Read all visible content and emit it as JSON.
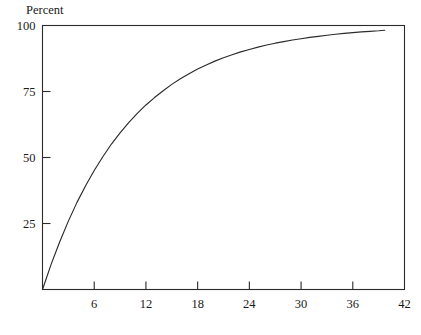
{
  "chart_data": {
    "type": "line",
    "title": "",
    "subtitle": "",
    "ylabel": "Percent",
    "xlabel": "",
    "xlim": [
      0,
      42
    ],
    "ylim": [
      0,
      100
    ],
    "grid": false,
    "legend": null,
    "x_ticks": [
      6,
      12,
      18,
      24,
      30,
      36,
      42
    ],
    "x_tick_labels": [
      "6",
      "12",
      "18",
      "24",
      "30",
      "36",
      "42"
    ],
    "y_ticks": [
      25,
      50,
      75,
      100
    ],
    "y_tick_labels": [
      "25",
      "50",
      "75",
      "100"
    ],
    "series": [
      {
        "name": "cumulative percent",
        "x": [
          0,
          1,
          2,
          3,
          4,
          5,
          6,
          7,
          8,
          9,
          10,
          11,
          12,
          13,
          14,
          15,
          16,
          17,
          18,
          19,
          20,
          21,
          22,
          23,
          24,
          25,
          26,
          27,
          28,
          29,
          30,
          31,
          32,
          33,
          34,
          35,
          36,
          37,
          38,
          39,
          39.7
        ],
        "values": [
          0,
          9.5,
          18.1,
          25.9,
          33,
          39.3,
          45.1,
          50.3,
          55.1,
          59.3,
          63.2,
          66.7,
          69.9,
          72.7,
          75.3,
          77.7,
          79.8,
          81.7,
          83.5,
          85,
          86.5,
          87.8,
          88.9,
          90,
          90.9,
          91.8,
          92.6,
          93.3,
          93.9,
          94.5,
          95,
          95.5,
          95.9,
          96.3,
          96.7,
          97,
          97.3,
          97.6,
          97.8,
          98,
          98.2
        ]
      }
    ],
    "annotations": [],
    "colors": {
      "curve": "#2b2b2b",
      "axis": "#2b2b2b",
      "background": "#ffffff",
      "text": "#1a1a1a"
    }
  },
  "labels": {
    "y_axis_title": "Percent"
  }
}
